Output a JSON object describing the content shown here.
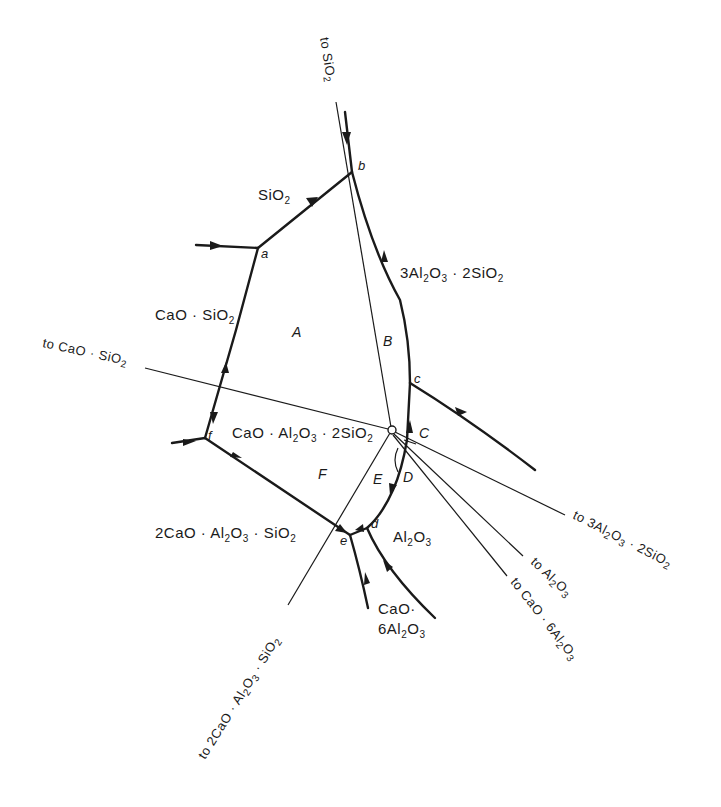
{
  "diagram": {
    "title": "",
    "type": "phase-diagram-fragment",
    "primary_phase_fields": [
      {
        "id": "sio2",
        "label": "SiO",
        "sub": "2"
      },
      {
        "id": "mullite",
        "label_parts": [
          "3Al",
          "2",
          "O",
          "3",
          " · 2SiO",
          "2"
        ]
      },
      {
        "id": "wollastonite",
        "label_parts": [
          "CaO · SiO",
          "2"
        ]
      },
      {
        "id": "anorthite",
        "label_parts": [
          "CaO · Al",
          "2",
          "O",
          "3",
          " · 2SiO",
          "2"
        ]
      },
      {
        "id": "gehlenite",
        "label_parts": [
          "2CaO · Al",
          "2",
          "O",
          "3",
          "  · SiO",
          "2"
        ]
      },
      {
        "id": "corundum",
        "label_parts": [
          "Al",
          "2",
          "O",
          "3"
        ]
      },
      {
        "id": "ca6",
        "line1": "CaO·",
        "line2_parts": [
          "6Al",
          "2",
          "O",
          "3"
        ]
      }
    ],
    "invariant_points": [
      "a",
      "b",
      "c",
      "d",
      "e",
      "f"
    ],
    "regions": [
      "A",
      "B",
      "C",
      "D",
      "E",
      "F"
    ],
    "tie_line_labels": [
      {
        "id": "to-sio2",
        "parts": [
          "to  SiO",
          "2"
        ]
      },
      {
        "id": "to-cao-sio2",
        "parts": [
          "to  CaO · SiO",
          "2"
        ]
      },
      {
        "id": "to-mullite",
        "parts": [
          "to  3Al",
          "2",
          "O",
          "3",
          " · 2SiO",
          "2"
        ]
      },
      {
        "id": "to-al2o3",
        "parts": [
          "to  Al",
          "2",
          "O",
          "3"
        ]
      },
      {
        "id": "to-ca6",
        "parts": [
          "to  CaO · 6Al",
          "2",
          "O",
          "3"
        ]
      },
      {
        "id": "to-gehlenite",
        "parts": [
          "to 2CaO · Al",
          "2",
          "O",
          "3",
          " · SiO",
          "2"
        ]
      }
    ],
    "central_point": "CaO·Al2O3·2SiO2 composition (open circle)"
  }
}
